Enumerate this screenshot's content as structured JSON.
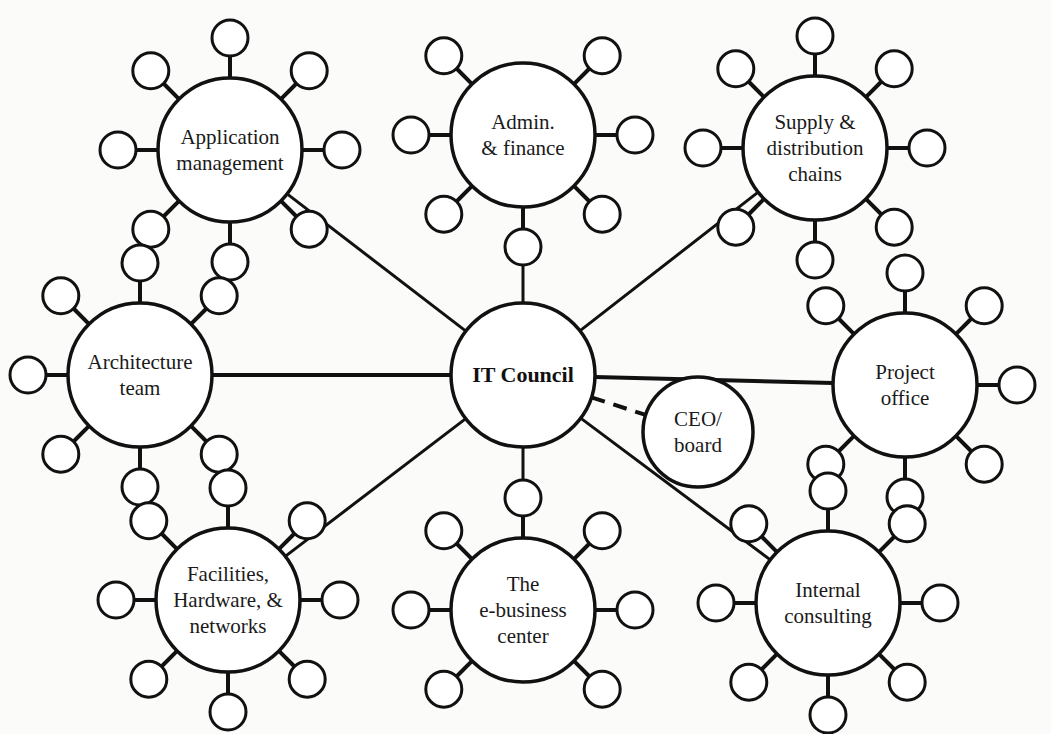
{
  "diagram": {
    "center": {
      "id": "it-council",
      "label": [
        "IT Council"
      ],
      "cx": 523,
      "cy": 375,
      "r": 72
    },
    "advisor": {
      "id": "ceo-board",
      "label": [
        "CEO/",
        "board"
      ],
      "cx": 698,
      "cy": 432,
      "r": 55,
      "connector": "dashed"
    },
    "hubs": [
      {
        "id": "application-management",
        "label": [
          "Application",
          "management"
        ],
        "cx": 230,
        "cy": 150,
        "r": 72,
        "satellite_angles": [
          0,
          45,
          90,
          135,
          180,
          225,
          270,
          315
        ]
      },
      {
        "id": "admin-finance",
        "label": [
          "Admin.",
          "&  finance"
        ],
        "cx": 523,
        "cy": 135,
        "r": 72,
        "satellite_angles": [
          0,
          45,
          135,
          180,
          225,
          270,
          315
        ]
      },
      {
        "id": "supply-distribution-chains",
        "label": [
          "Supply &",
          "distribution",
          "chains"
        ],
        "cx": 815,
        "cy": 148,
        "r": 72,
        "satellite_angles": [
          0,
          45,
          90,
          135,
          180,
          225,
          270,
          315
        ]
      },
      {
        "id": "architecture-team",
        "label": [
          "Architecture",
          "team"
        ],
        "cx": 140,
        "cy": 375,
        "r": 72,
        "satellite_angles": [
          45,
          90,
          135,
          180,
          225,
          270,
          315
        ]
      },
      {
        "id": "project-office",
        "label": [
          "Project",
          "office"
        ],
        "cx": 905,
        "cy": 385,
        "r": 72,
        "satellite_angles": [
          0,
          45,
          90,
          135,
          225,
          270,
          315
        ]
      },
      {
        "id": "facilities-hardware-networks",
        "label": [
          "Facilities,",
          "Hardware, &",
          "networks"
        ],
        "cx": 228,
        "cy": 600,
        "r": 72,
        "satellite_angles": [
          0,
          45,
          90,
          135,
          180,
          225,
          270,
          315
        ]
      },
      {
        "id": "e-business-center",
        "label": [
          "The",
          "e-business",
          "center"
        ],
        "cx": 523,
        "cy": 610,
        "r": 72,
        "satellite_angles": [
          0,
          45,
          90,
          135,
          180,
          225,
          315
        ]
      },
      {
        "id": "internal-consulting",
        "label": [
          "Internal",
          "consulting"
        ],
        "cx": 828,
        "cy": 603,
        "r": 72,
        "satellite_angles": [
          0,
          45,
          90,
          135,
          180,
          225,
          270,
          315
        ]
      }
    ],
    "satellite": {
      "r": 18,
      "distance": 112
    },
    "colors": {
      "stroke": "#111111",
      "fill": "#ffffff",
      "background": "#fbfbfa"
    }
  }
}
